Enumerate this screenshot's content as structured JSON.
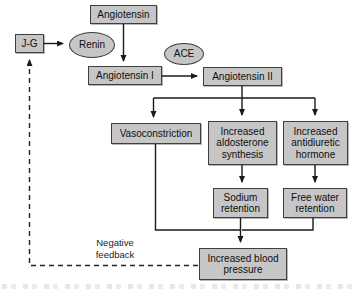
{
  "diagram": {
    "title_hint": "renin-angiotensin-aldosterone flowchart",
    "nodes": {
      "angiotensin": {
        "label": "Angiotensin"
      },
      "jg": {
        "label": "J-G"
      },
      "renin": {
        "label": "Renin"
      },
      "ace": {
        "label": "ACE"
      },
      "angiotensin_i": {
        "label": "Angiotensin I"
      },
      "angiotensin_ii": {
        "label": "Angiotensin II"
      },
      "vasoconstriction": {
        "label": "Vasoconstriction"
      },
      "aldosterone": {
        "label": "Increased aldosterone synthesis"
      },
      "adh": {
        "label": "Increased antidiuretic hormone"
      },
      "sodium": {
        "label": "Sodium retention"
      },
      "free_water": {
        "label": "Free water retention"
      },
      "increased_bp": {
        "label": "Increased blood pressure"
      }
    },
    "annotations": {
      "negative_feedback": "Negative feedback"
    },
    "colors": {
      "node_fill": "#c6c6c6",
      "node_border": "#3f3f3f",
      "line": "#1a1a1a",
      "background": "#ffffff"
    }
  }
}
